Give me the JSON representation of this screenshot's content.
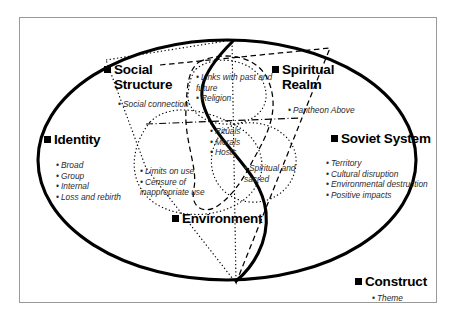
{
  "diagram": {
    "title_present": false,
    "type": "venn-overlap-concept-map",
    "background_color": "#ffffff",
    "frame_color": "#9a9a9a",
    "line_color": "#000000",
    "groups": [
      {
        "id": "identity",
        "heading": "Identity",
        "heading_lines": [
          "Identity"
        ],
        "items": [
          "Broad",
          "Group",
          "Internal",
          "Loss and rebirth"
        ],
        "boundary_style": "solid-ellipse"
      },
      {
        "id": "social-structure",
        "heading": "Social Structure",
        "heading_lines": [
          "Social",
          "Structure"
        ],
        "items": [
          "Social connection"
        ],
        "boundary_style": "dotted-polygon"
      },
      {
        "id": "spiritual-realm",
        "heading": "Spiritual Realm",
        "heading_lines": [
          "Spiritual",
          "Realm"
        ],
        "items": [
          "Pantheon Above"
        ],
        "boundary_style": "dashed-polygon"
      },
      {
        "id": "soviet-system",
        "heading": "Soviet System",
        "heading_lines": [
          "Soviet System"
        ],
        "items": [
          "Territory",
          "Cultural disruption",
          "Environmental destruction",
          "Positive impacts"
        ],
        "boundary_style": "dashed-polygon"
      },
      {
        "id": "environment",
        "heading": "Environment",
        "heading_lines": [
          "Environment"
        ],
        "items": [],
        "boundary_style": "solid-s-curve"
      }
    ],
    "overlaps": [
      {
        "id": "links-religion",
        "items": [
          "Links with past and future",
          "Religion"
        ]
      },
      {
        "id": "rituals-morals-hosts",
        "items": [
          "Rituals",
          "Morals",
          "Hosts"
        ]
      },
      {
        "id": "limits-censure",
        "items": [
          "Limits on use",
          "Censure of inappropriate use"
        ]
      },
      {
        "id": "spiritual-sacred",
        "items": [
          "Spiritual and sacred"
        ]
      }
    ],
    "legend": {
      "heading": "Construct",
      "heading_lines": [
        "Construct"
      ],
      "items": [
        "Theme"
      ]
    }
  }
}
